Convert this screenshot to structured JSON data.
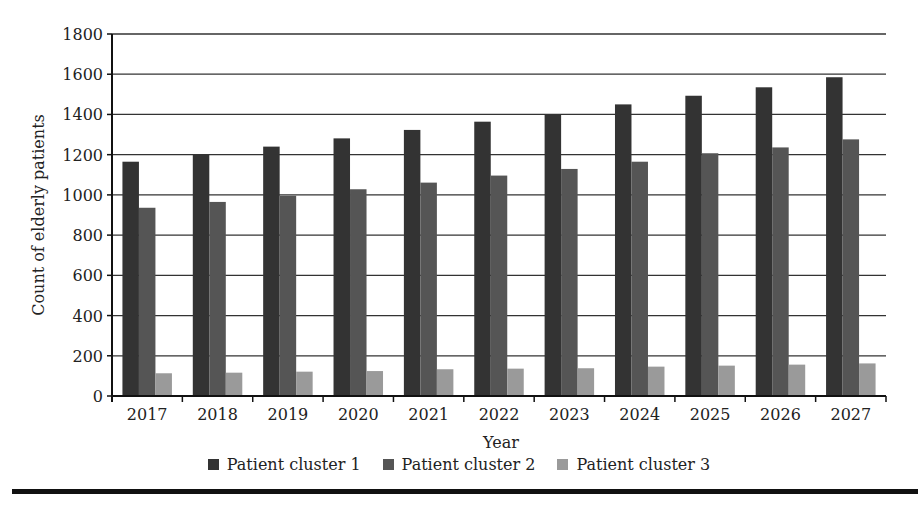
{
  "chart_data": {
    "type": "bar",
    "title": "",
    "xlabel": "Year",
    "ylabel": "Count of elderly patients",
    "ylim": [
      0,
      1800
    ],
    "yticks": [
      0,
      200,
      400,
      600,
      800,
      1000,
      1200,
      1400,
      1600,
      1800
    ],
    "grid": true,
    "legend_position": "bottom",
    "categories": [
      "2017",
      "2018",
      "2019",
      "2020",
      "2021",
      "2022",
      "2023",
      "2024",
      "2025",
      "2026",
      "2027"
    ],
    "series": [
      {
        "name": "Patient cluster 1",
        "color": "#333333",
        "values": [
          1165,
          1203,
          1240,
          1281,
          1323,
          1364,
          1402,
          1450,
          1493,
          1535,
          1585
        ]
      },
      {
        "name": "Patient cluster 2",
        "color": "#555555",
        "values": [
          936,
          965,
          996,
          1028,
          1061,
          1096,
          1129,
          1165,
          1207,
          1236,
          1276
        ]
      },
      {
        "name": "Patient cluster 3",
        "color": "#9a9a9a",
        "values": [
          113,
          116,
          121,
          124,
          133,
          136,
          138,
          146,
          151,
          156,
          162
        ]
      }
    ]
  }
}
